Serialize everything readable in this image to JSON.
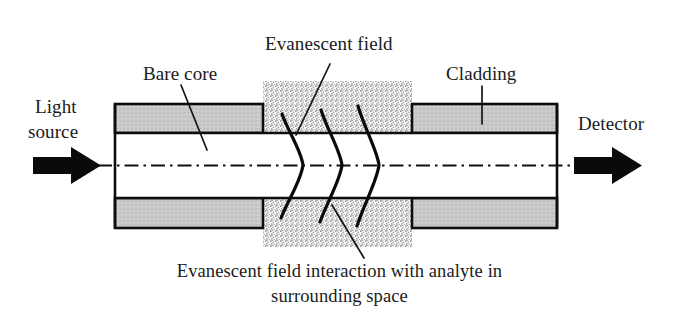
{
  "figure": {
    "background_color": "#ffffff",
    "width": 679,
    "height": 312
  },
  "labels": {
    "light_source_line1": "Light",
    "light_source_line2": "source",
    "detector": "Detector",
    "bare_core": "Bare core",
    "evanescent_field": "Evanescent field",
    "cladding": "Cladding",
    "caption_line1": "Evanescent field interaction with analyte in",
    "caption_line2": "surrounding space"
  },
  "colors": {
    "cladding_fill": "#c9c9c9",
    "core_fill": "#ffffff",
    "stipple_fill": "#d5d5d5",
    "outline": "#0d0d0d",
    "text": "#1a1a1a",
    "arrow": "#0a0a0a"
  },
  "geometry": {
    "fiber_left": 115,
    "fiber_right": 557,
    "fiber_top": 104,
    "fiber_bottom": 228,
    "core_top": 133,
    "core_bottom": 198,
    "centerline_y": 165.5,
    "stipple_left": 263,
    "stipple_right": 412,
    "stipple_top": 81,
    "stipple_bottom": 247
  },
  "elements": {
    "input_arrow_name": "light-source-arrow",
    "output_arrow_name": "detector-arrow",
    "centerline_name": "optical-axis-centerline",
    "wave_count": 3
  }
}
